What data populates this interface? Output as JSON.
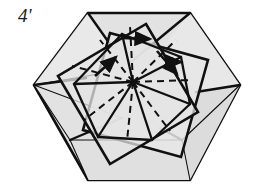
{
  "figure": {
    "domain_kind": "diagram",
    "step_label": "4'",
    "caption_present": false,
    "background_color": "#ffffff",
    "paper_fill": "#e2e2e2",
    "paper_fill_light": "#ececec",
    "paper_fill_shadow": "#d4d4d4",
    "line_color": "#101010",
    "dash_color": "#101010",
    "outline_width": 2.6,
    "inner_width": 2.2,
    "thin_width": 1.0,
    "dash_width": 2.0,
    "dash_pattern": "7,5"
  },
  "geometry": {
    "canvas": {
      "width": 254,
      "height": 196
    },
    "center": {
      "x": 133,
      "y": 82
    },
    "hexagon": {
      "name": "outer-hexagon-sheet",
      "points": "88,13 190,13 240,85 190,180 88,180 34,85"
    },
    "facets": [
      {
        "name": "facet-left-upper",
        "points": "34,85 88,13 120,58 110,72",
        "fill": "#e6e6e6"
      },
      {
        "name": "facet-left-lower",
        "points": "34,85 110,72 122,118 70,140",
        "fill": "#e2e2e2"
      },
      {
        "name": "facet-bottom-left",
        "points": "34,85 70,140 88,180 88,180",
        "fill": "#dedede"
      },
      {
        "name": "facet-bottom-band",
        "points": "70,140 182,140 190,180 88,180",
        "fill": "#e0e0e0"
      },
      {
        "name": "facet-right-upper",
        "points": "190,13 240,85 196,92 168,40",
        "fill": "#e6e6e6"
      },
      {
        "name": "facet-right-lower",
        "points": "240,85 190,180 182,140 196,92",
        "fill": "#dcdcdc"
      }
    ],
    "squares": [
      {
        "name": "square-outer-tilted",
        "points": "110,33 208,60 181,157 83,130",
        "rotation_deg": 16
      },
      {
        "name": "square-inner-tilted",
        "points": "146,24 198,112 110,164 58,76",
        "rotation_deg": 59
      }
    ],
    "pinwheel_spokes": [
      {
        "name": "spoke-north",
        "x1": 133,
        "y1": 82,
        "x2": 122,
        "y2": 34
      },
      {
        "name": "spoke-northeast",
        "x1": 133,
        "y1": 82,
        "x2": 181,
        "y2": 57
      },
      {
        "name": "spoke-east",
        "x1": 133,
        "y1": 82,
        "x2": 190,
        "y2": 104
      },
      {
        "name": "spoke-southeast",
        "x1": 133,
        "y1": 82,
        "x2": 152,
        "y2": 140
      },
      {
        "name": "spoke-south",
        "x1": 133,
        "y1": 82,
        "x2": 98,
        "y2": 137
      },
      {
        "name": "spoke-west",
        "x1": 133,
        "y1": 82,
        "x2": 74,
        "y2": 84
      }
    ],
    "dashed_creases": [
      {
        "name": "crease-a",
        "x1": 133,
        "y1": 82,
        "x2": 130,
        "y2": 26
      },
      {
        "name": "crease-b",
        "x1": 133,
        "y1": 82,
        "x2": 176,
        "y2": 40
      },
      {
        "name": "crease-c",
        "x1": 133,
        "y1": 82,
        "x2": 192,
        "y2": 80
      },
      {
        "name": "crease-d",
        "x1": 133,
        "y1": 82,
        "x2": 170,
        "y2": 131
      },
      {
        "name": "crease-e",
        "x1": 133,
        "y1": 82,
        "x2": 127,
        "y2": 141
      },
      {
        "name": "crease-f",
        "x1": 133,
        "y1": 82,
        "x2": 84,
        "y2": 120
      },
      {
        "name": "crease-g",
        "x1": 133,
        "y1": 82,
        "x2": 72,
        "y2": 66
      },
      {
        "name": "crease-h",
        "x1": 133,
        "y1": 82,
        "x2": 100,
        "y2": 40
      }
    ],
    "arrows": [
      {
        "name": "arrow-top-right",
        "x1": 122,
        "y1": 38,
        "x2": 152,
        "y2": 39,
        "note": "horizontal rotation arrow at top"
      },
      {
        "name": "arrow-left-up",
        "x1": 96,
        "y1": 75,
        "x2": 117,
        "y2": 56,
        "note": "upward-right arrow on left facet"
      },
      {
        "name": "arrow-right-down",
        "x1": 158,
        "y1": 52,
        "x2": 179,
        "y2": 76,
        "note": "downward-right arrow on right facet"
      },
      {
        "name": "arrow-right-small",
        "x1": 165,
        "y1": 62,
        "x2": 183,
        "y2": 62,
        "note": "small horizontal arrow right of center"
      }
    ]
  }
}
